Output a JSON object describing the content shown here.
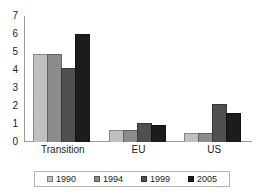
{
  "chart_data": {
    "type": "bar",
    "title": "",
    "subtitle": "",
    "xlabel": "",
    "ylabel": "",
    "categories": [
      "Transition",
      "EU",
      "US"
    ],
    "series": [
      {
        "name": "1990",
        "color": "#c0c0c0",
        "values": [
          4.9,
          0.65,
          0.5
        ]
      },
      {
        "name": "1994",
        "color": "#8c8c8c",
        "values": [
          4.9,
          0.65,
          0.5
        ]
      },
      {
        "name": "1999",
        "color": "#4f4f4f",
        "values": [
          4.1,
          1.05,
          2.1
        ]
      },
      {
        "name": "2005",
        "color": "#1c1c1c",
        "values": [
          6.0,
          0.95,
          1.6
        ]
      }
    ],
    "ylim": [
      0,
      7
    ],
    "yticks": [
      0,
      1,
      2,
      3,
      4,
      5,
      6,
      7
    ],
    "ytick_labels": [
      "0",
      "1",
      "2",
      "3",
      "4",
      "5",
      "6",
      "7"
    ],
    "grid": false,
    "legend_position": "bottom",
    "axis_color": "#9a9a9a",
    "background": "#ffffff"
  }
}
